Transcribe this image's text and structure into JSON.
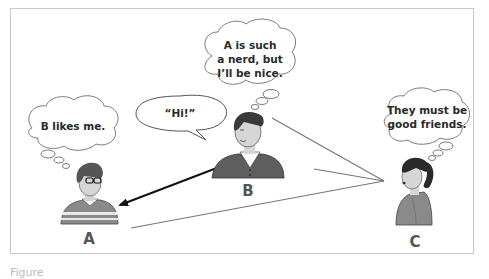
{
  "figure": {
    "caption_visible_fragment": "Figure",
    "colors": {
      "frame_border": "#c8c8c8",
      "bubble_stroke": "#7a7a7a",
      "text": "#2a2a2a",
      "label": "#555555",
      "arrow": "#111111",
      "line": "#777777",
      "shirt": "#8a8a8a",
      "hair": "#333333",
      "skin": "#d6d6d6"
    },
    "people": [
      {
        "id": "A",
        "label": "A",
        "thought": "B likes me."
      },
      {
        "id": "B",
        "label": "B",
        "speech": "“Hi!”",
        "thought_lines": [
          "A is such",
          "a nerd, but",
          "I’ll be nice."
        ]
      },
      {
        "id": "C",
        "label": "C",
        "thought_lines": [
          "They must be",
          "good friends."
        ]
      }
    ],
    "connections": [
      {
        "from": "B",
        "to": "A",
        "type": "arrow"
      },
      {
        "from": "A",
        "to": "C",
        "type": "line"
      },
      {
        "from": "B",
        "to": "C",
        "type": "line"
      }
    ]
  }
}
